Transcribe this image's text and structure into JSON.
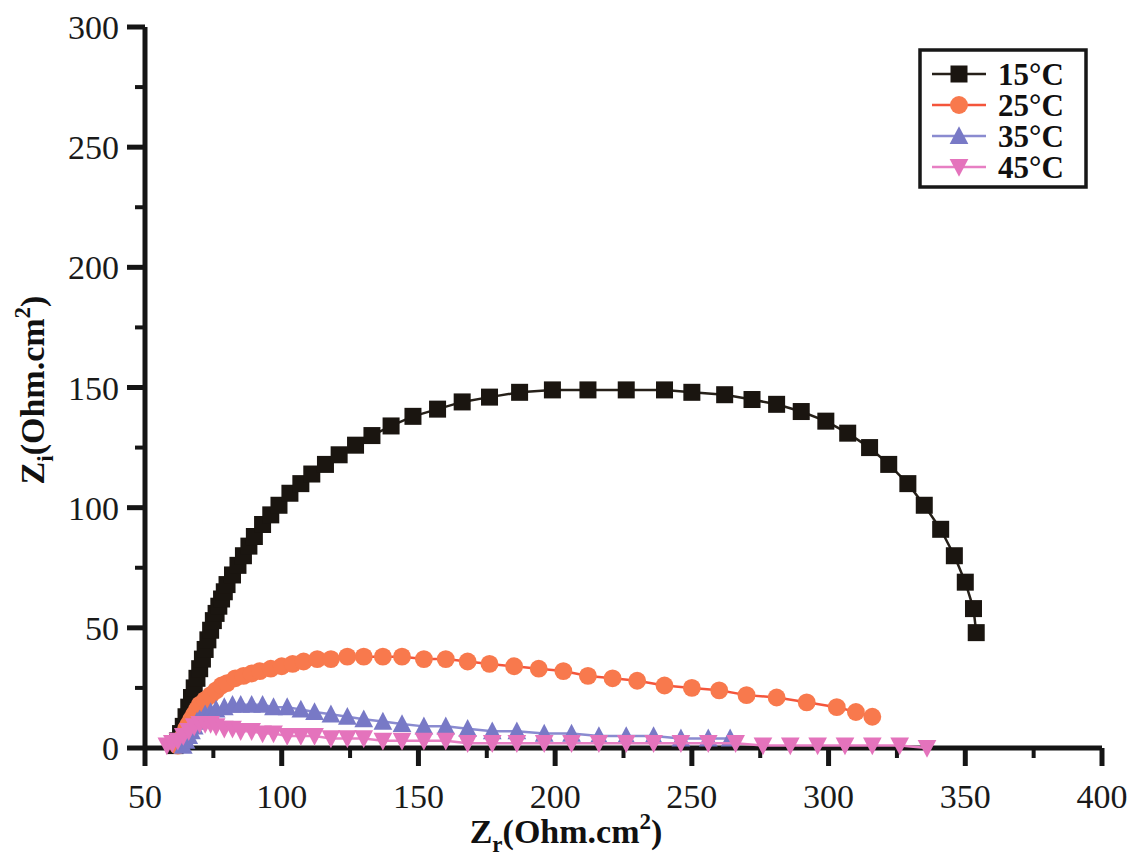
{
  "chart_data": {
    "type": "scatter",
    "title": "",
    "subtitle": "",
    "xlabel": "Z_r(Ohm.cm2)",
    "ylabel": "Z_i(Ohm.cm2)",
    "xlabel_parts": {
      "base": "Z",
      "sub": "r",
      "mid": "(Ohm.cm",
      "sup": "2",
      "close": ")"
    },
    "ylabel_parts": {
      "base": "Z",
      "sub": "i",
      "mid": "(Ohm.cm",
      "sup": "2",
      "close": ")"
    },
    "xlim": [
      50,
      400
    ],
    "ylim": [
      0,
      300
    ],
    "xticks": [
      50,
      100,
      150,
      200,
      250,
      300,
      350,
      400
    ],
    "yticks": [
      0,
      50,
      100,
      150,
      200,
      250,
      300
    ],
    "xticklabels": [
      "50",
      "100",
      "150",
      "200",
      "250",
      "300",
      "350",
      "400"
    ],
    "yticklabels": [
      "0",
      "50",
      "100",
      "150",
      "200",
      "250",
      "300"
    ],
    "x_minor_ticks": [
      75,
      125,
      175,
      225,
      275,
      325,
      375
    ],
    "y_minor_ticks": [
      25,
      75,
      125,
      175,
      225,
      275
    ],
    "grid": false,
    "legend_position": "top-right",
    "series": [
      {
        "name": "15°C",
        "label": "15°C",
        "color": "#1a1510",
        "line_color": "#262019",
        "marker": "square",
        "marker_size": 17,
        "points": [
          [
            61,
            1
          ],
          [
            62,
            3
          ],
          [
            63,
            6
          ],
          [
            64,
            9
          ],
          [
            65,
            13
          ],
          [
            66,
            17
          ],
          [
            67,
            21
          ],
          [
            68,
            25
          ],
          [
            69,
            29
          ],
          [
            70,
            33
          ],
          [
            71,
            37
          ],
          [
            72,
            41
          ],
          [
            73,
            45
          ],
          [
            74,
            49
          ],
          [
            75,
            53
          ],
          [
            76,
            56
          ],
          [
            77,
            59
          ],
          [
            78,
            62
          ],
          [
            79,
            65
          ],
          [
            80,
            68
          ],
          [
            82,
            72
          ],
          [
            84,
            76
          ],
          [
            86,
            80
          ],
          [
            88,
            84
          ],
          [
            90,
            88
          ],
          [
            93,
            93
          ],
          [
            96,
            97
          ],
          [
            99,
            101
          ],
          [
            103,
            106
          ],
          [
            107,
            110
          ],
          [
            111,
            114
          ],
          [
            116,
            118
          ],
          [
            121,
            122
          ],
          [
            127,
            126
          ],
          [
            133,
            130
          ],
          [
            140,
            134
          ],
          [
            148,
            138
          ],
          [
            157,
            141
          ],
          [
            166,
            144
          ],
          [
            176,
            146
          ],
          [
            187,
            148
          ],
          [
            199,
            149
          ],
          [
            212,
            149
          ],
          [
            226,
            149
          ],
          [
            240,
            149
          ],
          [
            250,
            148
          ],
          [
            262,
            147
          ],
          [
            272,
            145
          ],
          [
            281,
            143
          ],
          [
            290,
            140
          ],
          [
            299,
            136
          ],
          [
            307,
            131
          ],
          [
            315,
            125
          ],
          [
            322,
            118
          ],
          [
            329,
            110
          ],
          [
            335,
            101
          ],
          [
            341,
            91
          ],
          [
            346,
            80
          ],
          [
            350,
            69
          ],
          [
            353,
            58
          ],
          [
            354,
            48
          ]
        ]
      },
      {
        "name": "25°C",
        "label": "25°C",
        "color": "#F8794D",
        "line_color": "#F4553B",
        "marker": "circle",
        "marker_size": 17,
        "points": [
          [
            62,
            1
          ],
          [
            63,
            3
          ],
          [
            64,
            5
          ],
          [
            65,
            8
          ],
          [
            66,
            10
          ],
          [
            67,
            12
          ],
          [
            68,
            14
          ],
          [
            69,
            16
          ],
          [
            70,
            18
          ],
          [
            72,
            20
          ],
          [
            74,
            22
          ],
          [
            76,
            24
          ],
          [
            78,
            26
          ],
          [
            80,
            27
          ],
          [
            83,
            29
          ],
          [
            86,
            30
          ],
          [
            89,
            31
          ],
          [
            92,
            32
          ],
          [
            96,
            33
          ],
          [
            100,
            34
          ],
          [
            104,
            35
          ],
          [
            108,
            36
          ],
          [
            113,
            37
          ],
          [
            118,
            37
          ],
          [
            124,
            38
          ],
          [
            130,
            38
          ],
          [
            137,
            38
          ],
          [
            144,
            38
          ],
          [
            152,
            37
          ],
          [
            160,
            37
          ],
          [
            168,
            36
          ],
          [
            176,
            35
          ],
          [
            185,
            34
          ],
          [
            194,
            33
          ],
          [
            203,
            32
          ],
          [
            212,
            30
          ],
          [
            221,
            29
          ],
          [
            230,
            28
          ],
          [
            240,
            26
          ],
          [
            250,
            25
          ],
          [
            260,
            24
          ],
          [
            270,
            22
          ],
          [
            281,
            21
          ],
          [
            292,
            19
          ],
          [
            303,
            17
          ],
          [
            310,
            15
          ],
          [
            316,
            13
          ]
        ]
      },
      {
        "name": "35°C",
        "label": "35°C",
        "color": "#7879C6",
        "line_color": "#8A8BD0",
        "marker": "triangle-up",
        "marker_size": 17,
        "points": [
          [
            64,
            1
          ],
          [
            65,
            3
          ],
          [
            66,
            5
          ],
          [
            67,
            7
          ],
          [
            68,
            9
          ],
          [
            69,
            11
          ],
          [
            70,
            12
          ],
          [
            72,
            14
          ],
          [
            74,
            15
          ],
          [
            76,
            16
          ],
          [
            79,
            17
          ],
          [
            82,
            18
          ],
          [
            85,
            18
          ],
          [
            89,
            18
          ],
          [
            93,
            18
          ],
          [
            97,
            17
          ],
          [
            102,
            17
          ],
          [
            107,
            16
          ],
          [
            112,
            15
          ],
          [
            118,
            14
          ],
          [
            124,
            13
          ],
          [
            130,
            12
          ],
          [
            137,
            11
          ],
          [
            144,
            10
          ],
          [
            152,
            9
          ],
          [
            160,
            9
          ],
          [
            168,
            8
          ],
          [
            177,
            7
          ],
          [
            186,
            7
          ],
          [
            196,
            6
          ],
          [
            206,
            6
          ],
          [
            216,
            5
          ],
          [
            226,
            5
          ],
          [
            236,
            5
          ],
          [
            246,
            4
          ],
          [
            256,
            4
          ],
          [
            264,
            4
          ]
        ]
      },
      {
        "name": "45°C",
        "label": "45°C",
        "color": "#E473BC",
        "line_color": "#E77FC3",
        "marker": "triangle-down",
        "marker_size": 17,
        "points": [
          [
            58,
            1
          ],
          [
            60,
            2
          ],
          [
            62,
            3
          ],
          [
            64,
            5
          ],
          [
            66,
            7
          ],
          [
            68,
            9
          ],
          [
            70,
            10
          ],
          [
            72,
            10
          ],
          [
            74,
            10
          ],
          [
            76,
            9
          ],
          [
            79,
            8
          ],
          [
            82,
            8
          ],
          [
            85,
            7
          ],
          [
            89,
            7
          ],
          [
            93,
            6
          ],
          [
            97,
            6
          ],
          [
            102,
            5
          ],
          [
            107,
            5
          ],
          [
            112,
            5
          ],
          [
            118,
            4
          ],
          [
            124,
            4
          ],
          [
            130,
            4
          ],
          [
            137,
            3
          ],
          [
            144,
            3
          ],
          [
            152,
            3
          ],
          [
            160,
            3
          ],
          [
            168,
            2
          ],
          [
            177,
            2
          ],
          [
            186,
            2
          ],
          [
            196,
            2
          ],
          [
            206,
            2
          ],
          [
            216,
            2
          ],
          [
            226,
            2
          ],
          [
            236,
            2
          ],
          [
            246,
            2
          ],
          [
            256,
            2
          ],
          [
            266,
            2
          ],
          [
            276,
            1
          ],
          [
            286,
            1
          ],
          [
            296,
            1
          ],
          [
            306,
            1
          ],
          [
            316,
            1
          ],
          [
            326,
            1
          ],
          [
            336,
            0
          ]
        ]
      }
    ]
  },
  "legend": {
    "entries": [
      {
        "label": "15°C"
      },
      {
        "label": "25°C"
      },
      {
        "label": "35°C"
      },
      {
        "label": "45°C"
      }
    ]
  }
}
